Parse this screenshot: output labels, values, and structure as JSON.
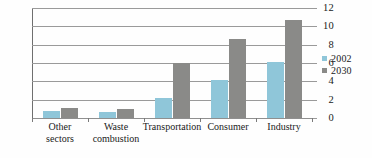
{
  "chart_data": {
    "type": "bar",
    "title": "",
    "subtitle": "",
    "xlabel": "",
    "ylabel": "",
    "ylim": [
      0,
      12
    ],
    "ytick_labels": [
      "0",
      "2",
      "4",
      "6",
      "8",
      "10",
      "12"
    ],
    "yticks": [
      0,
      2,
      4,
      6,
      8,
      10,
      12
    ],
    "grid": true,
    "grid_axis": "y",
    "legend_position": "right",
    "categories": [
      "Other\nsectors",
      "Waste\ncombustion",
      "Transportation",
      "Consumer",
      "Industry"
    ],
    "series": [
      {
        "name": "2002",
        "color": "#8fc6d9",
        "values": [
          0.8,
          0.7,
          2.2,
          4.1,
          6.1
        ]
      },
      {
        "name": "2030",
        "color": "#8a8a88",
        "values": [
          1.1,
          1.0,
          6.0,
          8.6,
          10.7
        ]
      }
    ]
  },
  "legend": {
    "items": [
      {
        "label": "2002",
        "color": "#8fc6d9"
      },
      {
        "label": "2030",
        "color": "#8a8a88"
      }
    ]
  },
  "colors": {
    "series_2002": "#8fc6d9",
    "series_2030": "#8a8a88",
    "grid": "#9a9a9a",
    "axis": "#6f6f6f",
    "text": "#1a1a1a",
    "background": "#fefefe"
  }
}
